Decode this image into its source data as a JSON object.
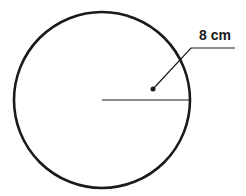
{
  "diagram": {
    "type": "circle-radius",
    "shape": "circle",
    "center": {
      "x": 102,
      "y": 100
    },
    "radius_px": 88,
    "radius_label": "8 cm",
    "colors": {
      "stroke": "#1a1a1a",
      "background": "#ffffff"
    }
  }
}
